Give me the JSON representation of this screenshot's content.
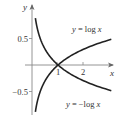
{
  "chart_data": {
    "type": "line",
    "title": "",
    "xlabel": "x",
    "ylabel": "y",
    "xlim": [
      -0.25,
      3.1
    ],
    "ylim": [
      -1.0,
      1.15
    ],
    "grid": false,
    "legend": "inline labels",
    "x_ticks": [
      {
        "value": 1,
        "label": "1"
      },
      {
        "value": 2,
        "label": "2"
      }
    ],
    "y_ticks": [
      {
        "value": 0.5,
        "label": "0.5"
      },
      {
        "value": -0.5,
        "label": "−0.5"
      }
    ],
    "series": [
      {
        "name": "y = log x",
        "label": "y = log x",
        "function": "log10(x)",
        "x": [
          0.13,
          0.2,
          0.3,
          0.5,
          0.75,
          1,
          1.5,
          2,
          2.5,
          3.05
        ],
        "values": [
          -0.886,
          -0.699,
          -0.523,
          -0.301,
          -0.125,
          0,
          0.176,
          0.301,
          0.398,
          0.484
        ]
      },
      {
        "name": "y = −log x",
        "label": "y = −log x",
        "function": "-log10(x)",
        "x": [
          0.13,
          0.2,
          0.3,
          0.5,
          0.75,
          1,
          1.5,
          2,
          2.5,
          3.05
        ],
        "values": [
          0.886,
          0.699,
          0.523,
          0.301,
          0.125,
          0,
          -0.176,
          -0.301,
          -0.398,
          -0.484
        ]
      }
    ],
    "intersection": {
      "x": 1,
      "y": 0
    },
    "colors": {
      "curve": "#222222",
      "axis": "#777777",
      "text": "#333333"
    }
  },
  "labels": {
    "x_axis": "x",
    "y_axis": "y",
    "tick_x_1": "1",
    "tick_x_2": "2",
    "tick_y_pos": "0.5",
    "tick_y_neg": "−0.5",
    "series_log": "y = log x",
    "series_neglog": "y = −log x"
  }
}
